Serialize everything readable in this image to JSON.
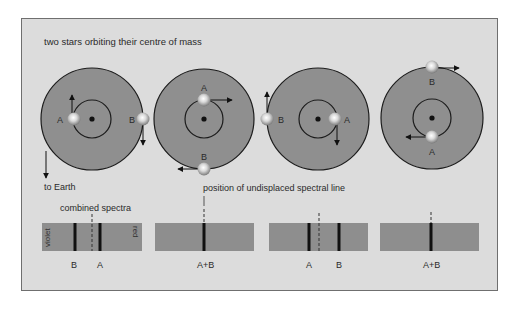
{
  "title": "two stars orbiting their centre of mass",
  "labels": {
    "to_earth": "to Earth",
    "combined_spectra": "combined spectra",
    "undisplaced": "position of undisplaced spectral line",
    "violet": "violet",
    "red": "red"
  },
  "colors": {
    "frame_bg": "#dcdcdc",
    "frame_border": "#6f6f6f",
    "orbit_fill": "#8f8f8f",
    "orbit_stroke": "#1c1c1c",
    "spectrum_fill": "#8e8e8e",
    "line": "#111111"
  },
  "panels": [
    {
      "star_a_label": "A",
      "star_b_label": "B",
      "spectrum_labels": [
        "B",
        "A"
      ]
    },
    {
      "star_a_label": "A",
      "star_b_label": "B",
      "spectrum_labels": [
        "A+B"
      ]
    },
    {
      "star_a_label": "A",
      "star_b_label": "B",
      "spectrum_labels": [
        "A",
        "B"
      ]
    },
    {
      "star_a_label": "A",
      "star_b_label": "B",
      "spectrum_labels": [
        "A+B"
      ]
    }
  ]
}
